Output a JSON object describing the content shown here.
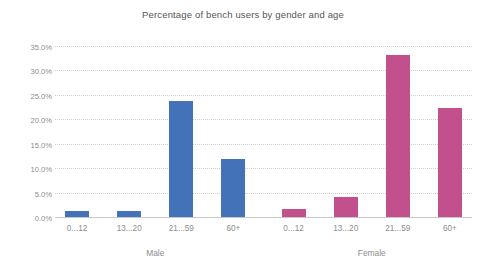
{
  "chart_data": {
    "type": "bar",
    "title": "Percentage of bench users by gender and age",
    "xlabel": "",
    "ylabel": "",
    "ylim": [
      0,
      35
    ],
    "ytick_step": 5,
    "ytick_labels": [
      "0.0%",
      "5.0%",
      "10.0%",
      "15.0%",
      "20.0%",
      "25.0%",
      "30.0%",
      "35.0%"
    ],
    "ytick_values": [
      0,
      5,
      10,
      15,
      20,
      25,
      30,
      35
    ],
    "grid": true,
    "grid_style": "dotted",
    "legend": "none",
    "categories": [
      "0...12",
      "13...20",
      "21...59",
      "60+"
    ],
    "groups": [
      "Male",
      "Female"
    ],
    "series": [
      {
        "name": "Male",
        "color": "#4472b8",
        "values": [
          1.5,
          1.5,
          24.0,
          12.0
        ]
      },
      {
        "name": "Female",
        "color": "#c2508c",
        "values": [
          1.8,
          4.4,
          33.3,
          22.5
        ]
      }
    ],
    "bars": [
      {
        "group": "Male",
        "category": "0...12",
        "value": 1.5,
        "color": "#4472b8"
      },
      {
        "group": "Male",
        "category": "13...20",
        "value": 1.5,
        "color": "#4472b8"
      },
      {
        "group": "Male",
        "category": "21...59",
        "value": 24.0,
        "color": "#4472b8"
      },
      {
        "group": "Male",
        "category": "60+",
        "value": 12.0,
        "color": "#4472b8"
      },
      {
        "group": "Female",
        "category": "0...12",
        "value": 1.8,
        "color": "#c2508c"
      },
      {
        "group": "Female",
        "category": "13...20",
        "value": 4.4,
        "color": "#c2508c"
      },
      {
        "group": "Female",
        "category": "21...59",
        "value": 33.3,
        "color": "#c2508c"
      },
      {
        "group": "Female",
        "category": "60+",
        "value": 22.5,
        "color": "#c2508c"
      }
    ],
    "colors": {
      "male": "#4472b8",
      "female": "#c2508c",
      "gridline": "#cfcfcf",
      "axis": "#c8c8c8",
      "text": "#8d8d8d",
      "title": "#555555",
      "background": "#ffffff"
    }
  }
}
